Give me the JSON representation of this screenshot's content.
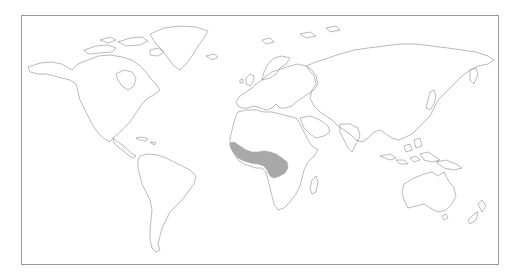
{
  "map": {
    "type": "world-outline-map",
    "projection": "equirectangular",
    "background": "#ffffff",
    "outline_color": "#8c8c8c",
    "frame_color": "#9a9a9a",
    "highlighted_region": {
      "description": "West and Central Africa (Guinea coast, Senegal to Gabon)",
      "fill_color": "#a9a9a9"
    },
    "continents": [
      "North America",
      "South America",
      "Europe",
      "Africa",
      "Asia",
      "Australia",
      "Greenland",
      "New Zealand"
    ]
  }
}
